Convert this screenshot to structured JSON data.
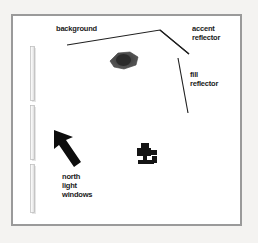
{
  "page": {
    "background_color": "#f4f3f1",
    "frame_color": "#9a9a9a",
    "canvas_color": "#ffffff",
    "ink_color": "#1a1a1a"
  },
  "diagram": {
    "type": "studio-lighting-floorplan",
    "labels": {
      "background": "background",
      "accent_reflector": [
        "accent",
        "reflector"
      ],
      "fill_reflector": [
        "fill",
        "reflector"
      ],
      "north_light_windows": [
        "north",
        "light",
        "windows"
      ]
    },
    "elements": {
      "subject_table": "dark elongated hexagon at center top",
      "camera": "black camera on tripod, lower center",
      "light_arrow": "thick black arrow pointing up-left",
      "window_panels": 3
    }
  }
}
